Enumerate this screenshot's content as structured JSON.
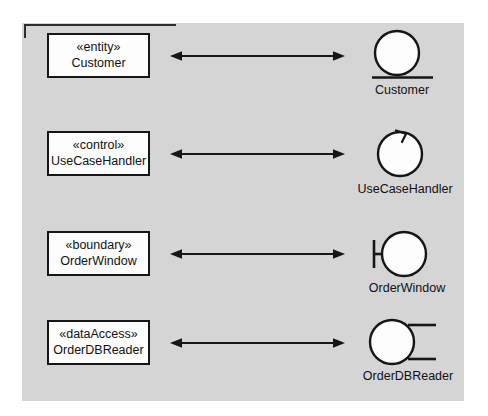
{
  "diagram": {
    "background_color": "#ffffff",
    "panel_color": "#d5d5d5",
    "line_color": "#161616",
    "box_fill": "#fdfdfd",
    "rows": [
      {
        "stereotype": "«entity»",
        "class_name": "Customer",
        "icon_name": "entity-icon",
        "icon_label": "Customer",
        "relation": "double-headed-arrow"
      },
      {
        "stereotype": "«control»",
        "class_name": "UseCaseHandler",
        "icon_name": "control-icon",
        "icon_label": "UseCaseHandler",
        "relation": "double-headed-arrow"
      },
      {
        "stereotype": "«boundary»",
        "class_name": "OrderWindow",
        "icon_name": "boundary-icon",
        "icon_label": "OrderWindow",
        "relation": "double-headed-arrow"
      },
      {
        "stereotype": "«dataAccess»",
        "class_name": "OrderDBReader",
        "icon_name": "dataaccess-icon",
        "icon_label": "OrderDBReader",
        "relation": "double-headed-arrow"
      }
    ]
  }
}
